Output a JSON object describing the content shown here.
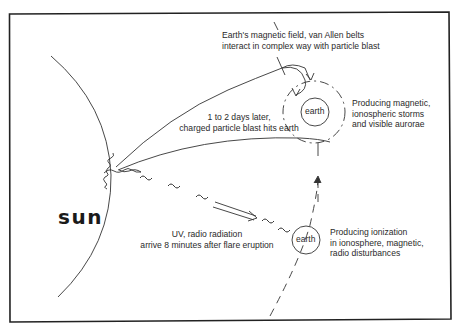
{
  "figure": {
    "title": "",
    "sun": {
      "label": "sun"
    },
    "earth_upper": {
      "label": "earth"
    },
    "earth_lower": {
      "label": "earth"
    },
    "annotations": {
      "magnetic_field": {
        "line1": "Earth's magnetic field, van Allen belts",
        "line2": "interact in complex way with particle blast"
      },
      "particle_blast": {
        "line1": "1 to 2 days later,",
        "line2": "charged particle blast hits earth"
      },
      "storms": {
        "line1": "Producing magnetic,",
        "line2": "ionospheric storms",
        "line3": "and visible aurorae"
      },
      "uv_radiation": {
        "line1": "UV, radio radiation",
        "line2": "arrive 8 minutes after flare eruption"
      },
      "ionization": {
        "line1": "Producing ionization",
        "line2": "in ionosphere, magnetic,",
        "line3": "radio disturbances"
      }
    },
    "colors": {
      "ink": "#2a2a2a",
      "background": "#ffffff",
      "frame": "#222222"
    }
  }
}
